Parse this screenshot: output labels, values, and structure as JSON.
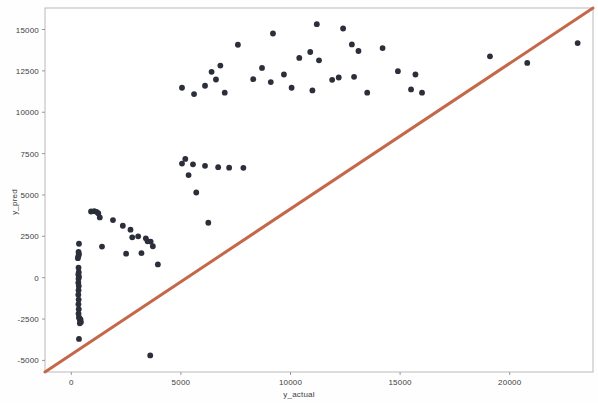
{
  "chart_data": {
    "type": "scatter",
    "title": "",
    "xlabel": "y_actual",
    "ylabel": "y_pred",
    "xlim": [
      -1200,
      23800
    ],
    "ylim": [
      -5700,
      16300
    ],
    "xticks": [
      0,
      5000,
      10000,
      15000,
      20000
    ],
    "xtick_labels": [
      "0",
      "5000",
      "10000",
      "15000",
      "20000"
    ],
    "yticks": [
      -5000,
      -2500,
      0,
      2500,
      5000,
      7500,
      10000,
      12500,
      15000
    ],
    "ytick_labels": [
      "-5000",
      "-2500",
      "0",
      "2500",
      "5000",
      "7500",
      "10000",
      "12500",
      "15000"
    ],
    "grid": false,
    "legend": null,
    "point_color": "#2b2f3a",
    "point_size": 4,
    "reference_line": {
      "name": "identity-line",
      "color": "#c4684a",
      "width": 3,
      "from": [
        -1200,
        -5700
      ],
      "to": [
        23800,
        16300
      ]
    },
    "series": [
      {
        "name": "predictions",
        "points": [
          [
            350,
            2050
          ],
          [
            330,
            1560
          ],
          [
            350,
            1420
          ],
          [
            320,
            1300
          ],
          [
            300,
            1180
          ],
          [
            330,
            600
          ],
          [
            340,
            330
          ],
          [
            320,
            200
          ],
          [
            350,
            60
          ],
          [
            330,
            -60
          ],
          [
            320,
            -300
          ],
          [
            340,
            -500
          ],
          [
            330,
            -760
          ],
          [
            320,
            -1030
          ],
          [
            335,
            -1320
          ],
          [
            325,
            -1600
          ],
          [
            340,
            -1900
          ],
          [
            330,
            -2180
          ],
          [
            350,
            -2400
          ],
          [
            380,
            -2480
          ],
          [
            420,
            -2520
          ],
          [
            400,
            -2620
          ],
          [
            440,
            -2680
          ],
          [
            390,
            -2760
          ],
          [
            350,
            -3700
          ],
          [
            900,
            4000
          ],
          [
            1050,
            4020
          ],
          [
            1150,
            3980
          ],
          [
            1230,
            3900
          ],
          [
            1300,
            3640
          ],
          [
            1900,
            3480
          ],
          [
            2350,
            3140
          ],
          [
            2700,
            2900
          ],
          [
            2780,
            2440
          ],
          [
            3050,
            2500
          ],
          [
            2500,
            1450
          ],
          [
            3200,
            1480
          ],
          [
            3400,
            2380
          ],
          [
            3480,
            2200
          ],
          [
            3620,
            2180
          ],
          [
            3720,
            1900
          ],
          [
            3950,
            800
          ],
          [
            1400,
            1880
          ],
          [
            3600,
            -4700
          ],
          [
            5050,
            6900
          ],
          [
            5200,
            7180
          ],
          [
            5550,
            6850
          ],
          [
            5350,
            6200
          ],
          [
            5700,
            5150
          ],
          [
            6100,
            6760
          ],
          [
            6700,
            6680
          ],
          [
            7200,
            6650
          ],
          [
            7850,
            6640
          ],
          [
            6250,
            3320
          ],
          [
            5050,
            11480
          ],
          [
            5600,
            11100
          ],
          [
            6100,
            11600
          ],
          [
            6600,
            11980
          ],
          [
            6400,
            12440
          ],
          [
            6800,
            12820
          ],
          [
            7000,
            11180
          ],
          [
            7600,
            14080
          ],
          [
            8300,
            12000
          ],
          [
            8700,
            12680
          ],
          [
            9200,
            14760
          ],
          [
            9100,
            11820
          ],
          [
            9700,
            12280
          ],
          [
            10050,
            11480
          ],
          [
            10400,
            13280
          ],
          [
            10900,
            13640
          ],
          [
            11200,
            15320
          ],
          [
            11300,
            13140
          ],
          [
            11000,
            11320
          ],
          [
            11900,
            11960
          ],
          [
            12200,
            12100
          ],
          [
            12400,
            15060
          ],
          [
            12800,
            14100
          ],
          [
            13100,
            13700
          ],
          [
            12900,
            12140
          ],
          [
            13500,
            11180
          ],
          [
            14200,
            13880
          ],
          [
            14900,
            12480
          ],
          [
            15700,
            12280
          ],
          [
            16000,
            11180
          ],
          [
            15500,
            11380
          ],
          [
            19100,
            13380
          ],
          [
            20800,
            12980
          ],
          [
            23100,
            14180
          ]
        ]
      }
    ]
  },
  "plot_geometry": {
    "left": 45,
    "top": 8,
    "right": 593,
    "bottom": 372
  }
}
